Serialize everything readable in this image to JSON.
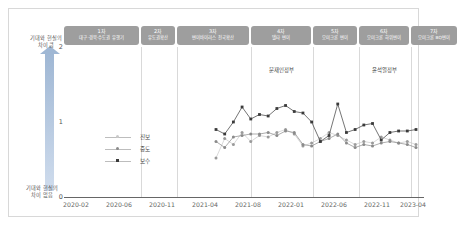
{
  "axis": {
    "y_top_note": "기대와 현실의\n차이 큼",
    "y_top_note_line1": "기대와 현실의",
    "y_top_note_line2": "차이 큼",
    "y_bottom_note_line1": "기대와 현실의",
    "y_bottom_note_line2": "차이 없음",
    "y_ticks": [
      "0",
      "1",
      "2"
    ],
    "x_ticks": [
      "2020-02",
      "2020-06",
      "2020-11",
      "2021-04",
      "2021-08",
      "2022-01",
      "2022-06",
      "2022-11",
      "2023-04"
    ]
  },
  "phases": [
    {
      "num": "1차",
      "desc": "대구·경북·수도권 유행기"
    },
    {
      "num": "2차",
      "desc": "유도권확산"
    },
    {
      "num": "3차",
      "desc": "변이바이러스 전국확산"
    },
    {
      "num": "4차",
      "desc": "델타 변이"
    },
    {
      "num": "5차",
      "desc": "오미크론 변이"
    },
    {
      "num": "6차",
      "desc": "오미크론 하위변이"
    },
    {
      "num": "7차",
      "desc": "오미크론 BQ변이"
    }
  ],
  "governments": [
    {
      "label": "문재인정부"
    },
    {
      "label": "윤석열정부"
    }
  ],
  "legend": [
    {
      "label": "진보",
      "color": "#c9c9c9"
    },
    {
      "label": "중도",
      "color": "#8a8a8a"
    },
    {
      "label": "보수",
      "color": "#3a3a3a"
    }
  ],
  "chart_data": {
    "type": "line",
    "title": "",
    "xlabel": "",
    "ylabel": "기대와 현실의 차이",
    "ylim": [
      0,
      2
    ],
    "grid": false,
    "legend_position": "inside-left",
    "x": [
      "2021-06",
      "2021-07",
      "2021-08",
      "2021-09",
      "2021-10",
      "2021-11",
      "2021-12",
      "2022-01",
      "2022-02",
      "2022-03",
      "2022-04",
      "2022-05",
      "2022-06",
      "2022-07",
      "2022-08",
      "2022-09",
      "2022-10",
      "2022-11",
      "2022-12",
      "2023-01",
      "2023-02",
      "2023-03",
      "2023-04",
      "2023-05"
    ],
    "series": [
      {
        "name": "진보",
        "color": "#c9c9c9",
        "values": [
          0.52,
          0.78,
          0.7,
          0.86,
          0.74,
          0.82,
          0.8,
          0.86,
          0.9,
          0.84,
          0.68,
          0.72,
          0.78,
          0.86,
          0.82,
          0.76,
          0.7,
          0.74,
          0.72,
          0.8,
          0.76,
          0.72,
          0.74,
          0.7
        ]
      },
      {
        "name": "중도",
        "color": "#8a8a8a",
        "values": [
          0.74,
          0.66,
          0.8,
          0.82,
          0.84,
          0.84,
          0.86,
          0.82,
          0.88,
          0.86,
          0.7,
          0.68,
          0.74,
          0.78,
          0.84,
          0.72,
          0.66,
          0.7,
          0.68,
          0.72,
          0.74,
          0.72,
          0.7,
          0.66
        ]
      },
      {
        "name": "보수",
        "color": "#3a3a3a",
        "values": [
          0.9,
          0.84,
          1.0,
          1.2,
          1.04,
          1.1,
          1.08,
          1.18,
          1.22,
          1.14,
          1.12,
          1.0,
          0.74,
          0.82,
          1.24,
          0.86,
          0.9,
          0.96,
          0.98,
          0.76,
          0.86,
          0.88,
          0.88,
          0.9
        ]
      }
    ]
  }
}
